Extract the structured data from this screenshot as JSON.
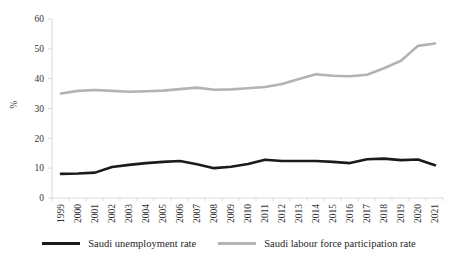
{
  "chart_data": {
    "type": "line",
    "title": "",
    "xlabel": "",
    "ylabel": "%",
    "ylim": [
      0,
      60
    ],
    "yticks": [
      0,
      10,
      20,
      30,
      40,
      50,
      60
    ],
    "grid": false,
    "legend_position": "bottom",
    "categories": [
      "1999",
      "2000",
      "2001",
      "2002",
      "2003",
      "2004",
      "2005",
      "2006",
      "2007",
      "2008",
      "2009",
      "2010",
      "2011",
      "2012",
      "2013",
      "2014",
      "2015",
      "2016",
      "2017",
      "2018",
      "2019",
      "2020",
      "2021"
    ],
    "series": [
      {
        "name": "Saudi unemployment rate",
        "color": "#1a1a1a",
        "values": [
          8.1,
          8.2,
          8.5,
          10.4,
          11.1,
          11.7,
          12.1,
          12.4,
          11.3,
          10.0,
          10.5,
          11.4,
          12.8,
          12.4,
          12.4,
          12.4,
          12.1,
          11.7,
          13.0,
          13.2,
          12.7,
          12.9,
          11.0
        ]
      },
      {
        "name": "Saudi labour force participation rate",
        "color": "#b3b3b3",
        "values": [
          35.0,
          35.9,
          36.2,
          35.9,
          35.6,
          35.8,
          36.0,
          36.5,
          37.0,
          36.3,
          36.4,
          36.8,
          37.2,
          38.2,
          39.9,
          41.5,
          41.0,
          40.8,
          41.3,
          43.5,
          46.0,
          51.0,
          51.8
        ]
      }
    ],
    "axis_color": "#d9d9d9",
    "tick_label_color": "#333333"
  }
}
